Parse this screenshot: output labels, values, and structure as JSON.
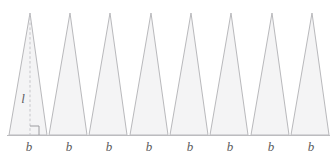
{
  "figure": {
    "type": "geometry-diagram",
    "background_color": "#ffffff",
    "triangle_fill": "#f4f4f5",
    "triangle_stroke": "#b9b9bc",
    "baseline_color": "#bcbcbf",
    "altitude_color": "#c6c6ca",
    "label_color": "#5c5c60",
    "triangle_count": 8,
    "geometry": {
      "baseline_y": 135,
      "baseline_x_start": 7,
      "baseline_x_end": 330,
      "apex_y": 13,
      "first_base_left_x": 9,
      "base_width": 38,
      "triangle_gap": 2,
      "apex_offset_ratio": 0.55
    },
    "altitude": {
      "label": "l",
      "label_x": 23,
      "label_y": 98,
      "x": 30,
      "top_y": 13,
      "bottom_y": 135,
      "right_angle_size": 9
    },
    "base_labels": [
      {
        "label": "b",
        "x": 29,
        "y": 140
      },
      {
        "label": "b",
        "x": 69,
        "y": 140
      },
      {
        "label": "b",
        "x": 109,
        "y": 140
      },
      {
        "label": "b",
        "x": 149,
        "y": 140
      },
      {
        "label": "b",
        "x": 190,
        "y": 140
      },
      {
        "label": "b",
        "x": 230,
        "y": 140
      },
      {
        "label": "b",
        "x": 271,
        "y": 140
      },
      {
        "label": "b",
        "x": 311,
        "y": 140
      }
    ],
    "triangles": [
      {
        "name": "triangle-1",
        "left_x": 9,
        "right_x": 47,
        "apex_x": 30
      },
      {
        "name": "triangle-2",
        "left_x": 49,
        "right_x": 87,
        "apex_x": 70
      },
      {
        "name": "triangle-3",
        "left_x": 89,
        "right_x": 127,
        "apex_x": 110
      },
      {
        "name": "triangle-4",
        "left_x": 130,
        "right_x": 168,
        "apex_x": 151
      },
      {
        "name": "triangle-5",
        "left_x": 170,
        "right_x": 208,
        "apex_x": 191
      },
      {
        "name": "triangle-6",
        "left_x": 210,
        "right_x": 248,
        "apex_x": 231
      },
      {
        "name": "triangle-7",
        "left_x": 251,
        "right_x": 289,
        "apex_x": 272
      },
      {
        "name": "triangle-8",
        "left_x": 291,
        "right_x": 329,
        "apex_x": 312
      }
    ]
  }
}
